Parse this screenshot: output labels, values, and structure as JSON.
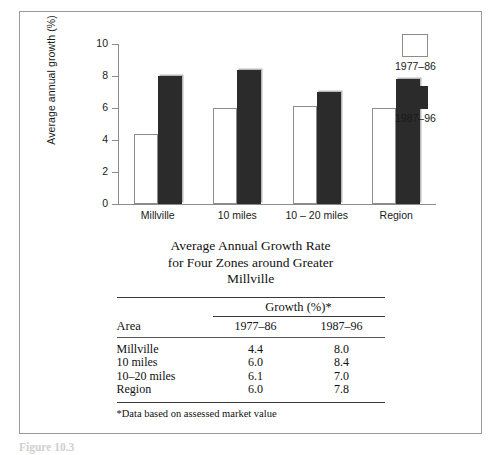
{
  "chart_data": {
    "type": "bar",
    "title": "",
    "xlabel": "",
    "ylabel": "Average annual growth (%)",
    "ylim": [
      0,
      10
    ],
    "yticks": [
      0,
      2,
      4,
      6,
      8,
      10
    ],
    "grid": false,
    "legend_position": "right",
    "categories": [
      "Millville",
      "10 miles",
      "10 – 20 miles",
      "Region"
    ],
    "series": [
      {
        "name": "1977–86",
        "color": "#ffffff",
        "values": [
          4.4,
          6.0,
          6.1,
          6.0
        ]
      },
      {
        "name": "1987–96",
        "color": "#2b2b2b",
        "values": [
          8.0,
          8.4,
          7.0,
          7.8
        ]
      }
    ]
  },
  "legend": {
    "items": [
      {
        "label": "1977–86",
        "swatch": "light"
      },
      {
        "label": "1987–96",
        "swatch": "dark"
      }
    ]
  },
  "table": {
    "title_lines": [
      "Average Annual Growth Rate",
      "for Four Zones around Greater",
      "Millville"
    ],
    "span_header": "Growth (%)*",
    "col_area": "Area",
    "col_period_1": "1977–86",
    "col_period_2": "1987–96",
    "rows": [
      {
        "area": "Millville",
        "p1": "4.4",
        "p2": "8.0"
      },
      {
        "area": "10 miles",
        "p1": "6.0",
        "p2": "8.4"
      },
      {
        "area": "10–20 miles",
        "p1": "6.1",
        "p2": "7.0"
      },
      {
        "area": "Region",
        "p1": "6.0",
        "p2": "7.8"
      }
    ],
    "footnote": "*Data based on assessed market value"
  },
  "caption": "Figure 10.3"
}
